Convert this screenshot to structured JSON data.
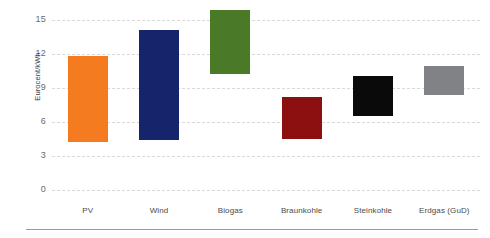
{
  "chart_data": {
    "type": "bar",
    "subtype": "floating-range-bar",
    "title": "",
    "xlabel": "",
    "ylabel": "Eurocent/kWh",
    "ylim": [
      0,
      15.9
    ],
    "yticks": [
      0,
      3,
      6,
      9,
      12,
      15
    ],
    "ytick_labels": [
      "0",
      "3",
      "6",
      "9",
      "12",
      "15"
    ],
    "grid": true,
    "grid_style": "dashed",
    "legend": false,
    "categories": [
      "PV",
      "Wind",
      "Biogas",
      "Braunkohle",
      "Steinkohle",
      "Erdgas (GuD)"
    ],
    "series": [
      {
        "name": "Stromgestehungskosten Bandbreite",
        "points": [
          {
            "category": "PV",
            "low": 4.2,
            "high": 11.8,
            "color": "#F47B20"
          },
          {
            "category": "Wind",
            "low": 4.4,
            "high": 14.1,
            "color": "#16256B"
          },
          {
            "category": "Biogas",
            "low": 10.2,
            "high": 15.9,
            "color": "#4A7A28"
          },
          {
            "category": "Braunkohle",
            "low": 4.5,
            "high": 8.2,
            "color": "#8C1010"
          },
          {
            "category": "Steinkohle",
            "low": 6.5,
            "high": 10.1,
            "color": "#0A0A0A"
          },
          {
            "category": "Erdgas (GuD)",
            "low": 8.4,
            "high": 10.9,
            "color": "#808285"
          }
        ]
      }
    ]
  },
  "colors": {
    "background": "#ffffff",
    "gridline": "#d9d9d9",
    "tick_text": "#6b6b6b",
    "label_text": "#4a4a4a",
    "axis_title_text": "#3d3d3d",
    "bottom_rule": "#9a9a9a"
  }
}
